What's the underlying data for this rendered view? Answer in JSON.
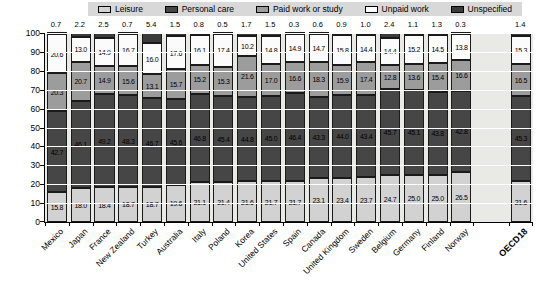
{
  "legend": {
    "items": [
      {
        "label": "Leisure",
        "color": "#d2d2d2"
      },
      {
        "label": "Personal care",
        "color": "#464646"
      },
      {
        "label": "Paid work or study",
        "color": "#9c9c9c"
      },
      {
        "label": "Unpaid work",
        "color": "#fbfbfb"
      },
      {
        "label": "Unspecified",
        "color": "#3c3c3c"
      }
    ],
    "background": "#d8d8d8"
  },
  "chart_data": {
    "type": "bar",
    "stacked": true,
    "title": "",
    "categories": [
      "Mexico",
      "Japan",
      "France",
      "New Zealand",
      "Turkey",
      "Australia",
      "Italy",
      "Poland",
      "Korea",
      "United States",
      "Spain",
      "Canada",
      "United Kingdom",
      "Sweden",
      "Belgium",
      "Germany",
      "Finland",
      "Norway",
      "OECD18"
    ],
    "series": [
      {
        "name": "Leisure",
        "color": "#d2d2d2",
        "label_inside": true,
        "values": [
          15.8,
          18.0,
          18.4,
          18.7,
          18.7,
          19.6,
          21.1,
          21.4,
          21.6,
          21.7,
          21.7,
          23.1,
          23.4,
          23.7,
          24.7,
          25.0,
          25.0,
          26.5,
          21.6
        ]
      },
      {
        "name": "Personal care",
        "color": "#464646",
        "label_inside": true,
        "values": [
          42.7,
          46.1,
          49.2,
          48.3,
          46.7,
          45.6,
          46.8,
          45.4,
          44.8,
          45.0,
          46.4,
          43.3,
          44.0,
          43.4,
          45.7,
          45.1,
          43.8,
          42.8,
          45.3
        ]
      },
      {
        "name": "Paid work or study",
        "color": "#9c9c9c",
        "label_inside": true,
        "values": [
          20.3,
          20.7,
          14.9,
          15.6,
          13.1,
          15.7,
          15.2,
          15.3,
          21.6,
          17.0,
          16.6,
          18.3,
          15.9,
          17.4,
          12.8,
          13.6,
          15.4,
          16.6,
          16.5
        ]
      },
      {
        "name": "Unpaid work",
        "color": "#fbfbfb",
        "label_inside": true,
        "values": [
          20.6,
          13.0,
          14.9,
          16.7,
          16.0,
          17.6,
          16.1,
          17.4,
          10.2,
          14.8,
          14.9,
          14.7,
          15.8,
          14.4,
          14.4,
          15.2,
          14.5,
          13.8,
          15.3
        ]
      },
      {
        "name": "Unspecified",
        "color": "#3c3c3c",
        "label_inside": false,
        "label_above_bar": true,
        "values": [
          0.7,
          2.2,
          2.5,
          0.7,
          5.4,
          1.5,
          0.8,
          0.5,
          1.7,
          1.5,
          0.3,
          0.6,
          0.9,
          1.0,
          2.4,
          1.1,
          1.3,
          0.3,
          1.4
        ]
      }
    ],
    "ylim": [
      0,
      100
    ],
    "ytick_step": 10,
    "yticks": [
      0,
      10,
      20,
      30,
      40,
      50,
      60,
      70,
      80,
      90,
      100
    ],
    "grid": true,
    "grid_color": "#ffffff",
    "plot_background": "#e9e9e5",
    "legend_position": "top",
    "gap_before_last_category": true,
    "bold_last_category": true
  }
}
